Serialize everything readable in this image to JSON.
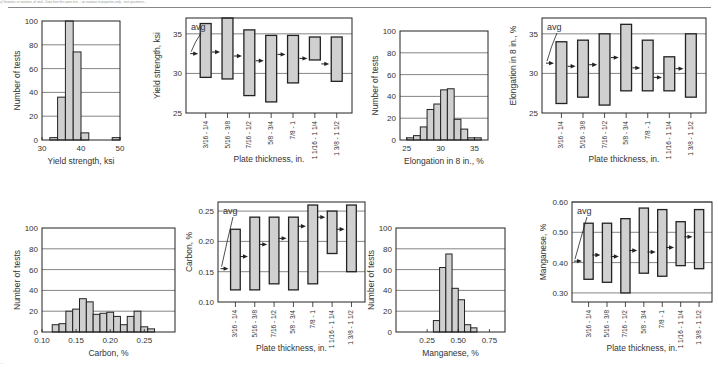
{
  "header": {
    "caption_fragment": "a) Variation, or variation, of steel...Data from the same test ... on variation in properties only... test specimens..."
  },
  "footer": {
    "caption_fragment": "..."
  },
  "chart_data": [
    {
      "type": "bar",
      "id": "yield-hist",
      "title": "",
      "xlabel": "Yield strength, ksi",
      "ylabel": "Number of tests",
      "xticks": [
        "30",
        "40",
        "50"
      ],
      "yticks": [
        "0",
        "20",
        "40",
        "60",
        "80",
        "100"
      ],
      "xlim": [
        30,
        50
      ],
      "ylim": [
        0,
        100
      ],
      "bins": [
        {
          "x0": 32,
          "x1": 34,
          "value": 2
        },
        {
          "x0": 34,
          "x1": 36,
          "value": 36
        },
        {
          "x0": 36,
          "x1": 38,
          "value": 100
        },
        {
          "x0": 38,
          "x1": 40,
          "value": 74
        },
        {
          "x0": 40,
          "x1": 42,
          "value": 6
        },
        {
          "x0": 48,
          "x1": 50,
          "value": 2
        }
      ]
    },
    {
      "type": "range",
      "id": "yield-range",
      "xlabel": "Plate thickness, in.",
      "ylabel": "Yield strength, ksi",
      "annotation": "avg",
      "yticks": [
        "25",
        "30",
        "35"
      ],
      "ylim": [
        25,
        37
      ],
      "categories": [
        "3/16 - 1/4",
        "5/16 - 3/8",
        "7/16 - 1/2",
        "5/8 - 3/4",
        "7/8 - 1",
        "1 1/16 - 1 1/4",
        "1 3/8 - 1 1/2"
      ],
      "min": [
        29.5,
        29.3,
        27.2,
        26.4,
        28.8,
        31.7,
        29.0
      ],
      "max": [
        36.3,
        37.0,
        35.5,
        34.8,
        34.8,
        34.6,
        34.6
      ],
      "avg": [
        32.5,
        32.7,
        32.2,
        31.6,
        32.4,
        31.9,
        31.2
      ]
    },
    {
      "type": "bar",
      "id": "elongation-hist",
      "xlabel": "Elongation in 8 in., %",
      "ylabel": "Number of tests",
      "xticks": [
        "25",
        "30",
        "35"
      ],
      "yticks": [
        "0",
        "20",
        "40",
        "60",
        "80",
        "100"
      ],
      "xlim": [
        24,
        37
      ],
      "ylim": [
        0,
        100
      ],
      "bins": [
        {
          "x0": 25,
          "x1": 26,
          "value": 2
        },
        {
          "x0": 26,
          "x1": 27,
          "value": 4
        },
        {
          "x0": 27,
          "x1": 28,
          "value": 12
        },
        {
          "x0": 28,
          "x1": 29,
          "value": 28
        },
        {
          "x0": 29,
          "x1": 30,
          "value": 33
        },
        {
          "x0": 30,
          "x1": 31,
          "value": 46
        },
        {
          "x0": 31,
          "x1": 32,
          "value": 47
        },
        {
          "x0": 32,
          "x1": 33,
          "value": 19
        },
        {
          "x0": 33,
          "x1": 34,
          "value": 10
        },
        {
          "x0": 34,
          "x1": 35,
          "value": 2
        },
        {
          "x0": 35,
          "x1": 36,
          "value": 2
        }
      ]
    },
    {
      "type": "range",
      "id": "elongation-range",
      "xlabel": "Plate thickness, in.",
      "ylabel": "Elongation in 8 in., %",
      "annotation": "avg",
      "yticks": [
        "25",
        "30",
        "35"
      ],
      "ylim": [
        25,
        37
      ],
      "categories": [
        "3/16 - 1/4",
        "5/16 - 3/8",
        "7/16 - 1/2",
        "5/8 - 3/4",
        "7/8 - 1",
        "1 1/16 - 1 1/4",
        "1 3/8 - 1 1/2"
      ],
      "min": [
        26.2,
        27.0,
        26.0,
        27.8,
        27.8,
        27.8,
        27.0
      ],
      "max": [
        34.0,
        34.2,
        35.0,
        36.2,
        34.2,
        32.1,
        35.0
      ],
      "avg": [
        31.3,
        30.9,
        31.1,
        32.0,
        30.7,
        29.5,
        30.6
      ]
    },
    {
      "type": "bar",
      "id": "carbon-hist",
      "xlabel": "Carbon, %",
      "ylabel": "Number of tests",
      "xticks": [
        "0.10",
        "0.15",
        "0.20",
        "0.25"
      ],
      "yticks": [
        "0",
        "20",
        "40",
        "60",
        "80",
        "100"
      ],
      "xlim": [
        0.1,
        0.295
      ],
      "ylim": [
        0,
        100
      ],
      "bins": [
        {
          "x0": 0.115,
          "x1": 0.125,
          "value": 7
        },
        {
          "x0": 0.125,
          "x1": 0.135,
          "value": 8
        },
        {
          "x0": 0.135,
          "x1": 0.145,
          "value": 20
        },
        {
          "x0": 0.145,
          "x1": 0.155,
          "value": 22
        },
        {
          "x0": 0.155,
          "x1": 0.165,
          "value": 32
        },
        {
          "x0": 0.165,
          "x1": 0.175,
          "value": 29
        },
        {
          "x0": 0.175,
          "x1": 0.185,
          "value": 17
        },
        {
          "x0": 0.185,
          "x1": 0.195,
          "value": 18
        },
        {
          "x0": 0.195,
          "x1": 0.205,
          "value": 19
        },
        {
          "x0": 0.205,
          "x1": 0.215,
          "value": 15
        },
        {
          "x0": 0.215,
          "x1": 0.225,
          "value": 7
        },
        {
          "x0": 0.225,
          "x1": 0.235,
          "value": 15
        },
        {
          "x0": 0.235,
          "x1": 0.245,
          "value": 20
        },
        {
          "x0": 0.245,
          "x1": 0.255,
          "value": 5
        },
        {
          "x0": 0.255,
          "x1": 0.265,
          "value": 3
        }
      ]
    },
    {
      "type": "range",
      "id": "carbon-range",
      "xlabel": "Plate thickness, in.",
      "ylabel": "Carbon, %",
      "annotation": "avg",
      "yticks": [
        "0.10",
        "0.15",
        "0.20",
        "0.25"
      ],
      "ylim": [
        0.1,
        0.265
      ],
      "categories": [
        "3/16 - 1/4",
        "5/16 - 3/8",
        "7/16 - 1/2",
        "5/8 - 3/4",
        "7/8 - 1",
        "1 1/16 - 1 1/4",
        "1 3/8 - 1 1/2"
      ],
      "min": [
        0.12,
        0.12,
        0.13,
        0.12,
        0.13,
        0.18,
        0.15
      ],
      "max": [
        0.22,
        0.24,
        0.24,
        0.24,
        0.26,
        0.25,
        0.26
      ],
      "avg": [
        0.155,
        0.175,
        0.195,
        0.205,
        0.225,
        0.24,
        0.22
      ]
    },
    {
      "type": "bar",
      "id": "manganese-hist",
      "xlabel": "Manganese, %",
      "ylabel": "Number of tests",
      "xticks": [
        "0.25",
        "0.50",
        "0.75"
      ],
      "yticks": [
        "0",
        "20",
        "40",
        "60",
        "80",
        "100"
      ],
      "xlim": [
        0.0,
        0.875
      ],
      "ylim": [
        0,
        100
      ],
      "bins": [
        {
          "x0": 0.3,
          "x1": 0.35,
          "value": 11
        },
        {
          "x0": 0.35,
          "x1": 0.4,
          "value": 62
        },
        {
          "x0": 0.4,
          "x1": 0.45,
          "value": 75
        },
        {
          "x0": 0.45,
          "x1": 0.5,
          "value": 42
        },
        {
          "x0": 0.5,
          "x1": 0.55,
          "value": 31
        },
        {
          "x0": 0.55,
          "x1": 0.6,
          "value": 7
        },
        {
          "x0": 0.6,
          "x1": 0.65,
          "value": 4
        }
      ]
    },
    {
      "type": "range",
      "id": "manganese-range",
      "xlabel": "Plate thickness, in.",
      "ylabel": "Manganese, %",
      "annotation": "avg",
      "yticks": [
        "0.30",
        "0.40",
        "0.50",
        "0.60"
      ],
      "ylim": [
        0.27,
        0.6
      ],
      "categories": [
        "3/16 - 1/4",
        "5/16 - 3/8",
        "7/16 - 1/2",
        "5/8 - 3/4",
        "7/8 - 1",
        "1 1/16 - 1 1/4",
        "1 3/8 - 1 1/2"
      ],
      "min": [
        0.345,
        0.335,
        0.3,
        0.365,
        0.355,
        0.39,
        0.38
      ],
      "max": [
        0.53,
        0.53,
        0.545,
        0.58,
        0.575,
        0.535,
        0.575
      ],
      "avg": [
        0.405,
        0.425,
        0.42,
        0.44,
        0.435,
        0.45,
        0.485
      ]
    }
  ],
  "layout": {
    "fill": "#d0d0d0",
    "stroke": "#222222",
    "grid": "#666666",
    "panels": [
      {
        "kind": "hist",
        "ref": 0,
        "box": [
          42,
          21,
          120,
          140
        ]
      },
      {
        "kind": "range",
        "ref": 1,
        "box": [
          186,
          18,
          352,
          113
        ]
      },
      {
        "kind": "hist",
        "ref": 2,
        "box": [
          400,
          31,
          488,
          140
        ]
      },
      {
        "kind": "range",
        "ref": 3,
        "box": [
          542,
          18,
          706,
          113
        ]
      },
      {
        "kind": "hist",
        "ref": 4,
        "box": [
          42,
          228,
          175,
          332
        ]
      },
      {
        "kind": "range",
        "ref": 5,
        "box": [
          218,
          202,
          365,
          302
        ]
      },
      {
        "kind": "hist",
        "ref": 6,
        "box": [
          396,
          228,
          505,
          332
        ]
      },
      {
        "kind": "range",
        "ref": 7,
        "box": [
          572,
          202,
          712,
          302
        ]
      }
    ]
  }
}
